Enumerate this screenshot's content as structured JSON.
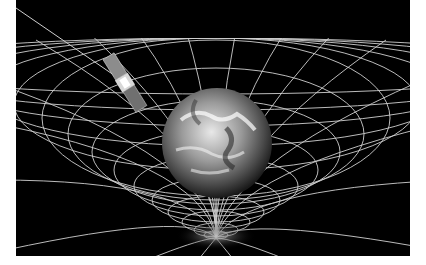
{
  "image": {
    "description": "Earth sitting in a curved spacetime grid with a satellite orbiting above",
    "background_color": "#000000",
    "grid_color": "#d8d8d8",
    "subjects": [
      "earth",
      "spacetime-grid",
      "satellite",
      "laser-beam"
    ]
  }
}
